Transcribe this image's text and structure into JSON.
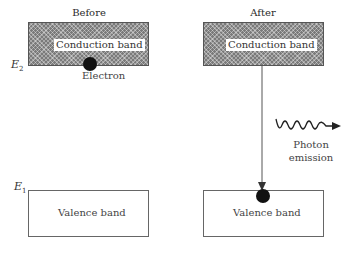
{
  "before": {
    "title": "Before",
    "conduction_band": "Conduction band",
    "valence_band": "Valence band",
    "electron_label": "Electron",
    "energy_upper": {
      "symbol": "E",
      "subscript": "2"
    },
    "energy_lower": {
      "symbol": "E",
      "subscript": "1"
    }
  },
  "after": {
    "title": "After",
    "conduction_band": "Conduction band",
    "valence_band": "Valence band",
    "photon_label_line1": "Photon",
    "photon_label_line2": "emission"
  },
  "colors": {
    "band_fill": "#7a7a7a",
    "electron": "#111111",
    "line": "#555555"
  }
}
